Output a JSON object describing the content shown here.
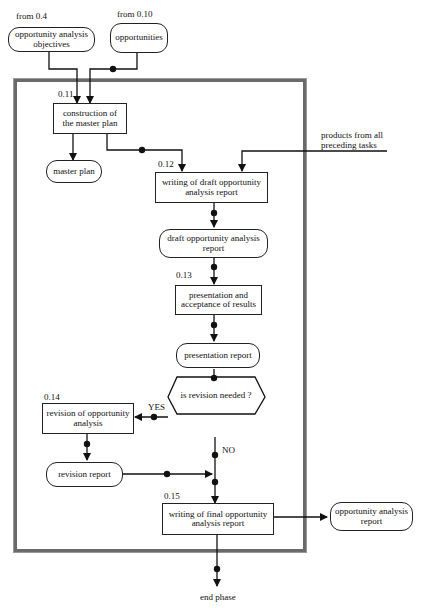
{
  "inputs": {
    "from_04": {
      "source": "from 0.4",
      "label": "opportunity analysis objectives"
    },
    "from_010": {
      "source": "from 0.10",
      "label": "opportunities"
    }
  },
  "tasks": [
    {
      "id": "0.11",
      "label": "construction of the master plan"
    },
    {
      "id": "0.12",
      "label": "writing of draft opportunity analysis report"
    },
    {
      "id": "0.13",
      "label": "presentation and acceptance of results"
    },
    {
      "id": "0.14",
      "label": "revision of opportunity analysis"
    },
    {
      "id": "0.15",
      "label": "writing of final opportunity analysis report"
    }
  ],
  "products": {
    "master_plan": "master plan",
    "draft_report": "draft opportunity analysis report",
    "presentation_report": "presentation report",
    "revision_report": "revision report",
    "final_report": "opportunity analysis report"
  },
  "decision": {
    "question": "is revision needed ?",
    "yes": "YES",
    "no": "NO"
  },
  "external_input": "products from all preceding tasks",
  "end": "end phase"
}
